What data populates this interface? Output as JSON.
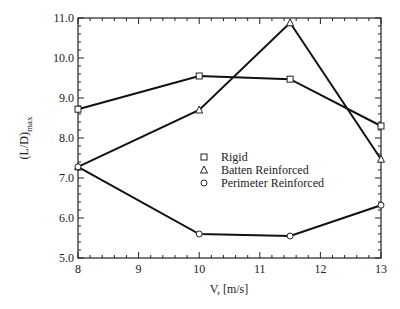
{
  "chart_data": {
    "type": "line",
    "title": "",
    "xlabel": "V, [m/s]",
    "ylabel": "(L/D)",
    "ylabel_subscript": "max",
    "xlim": [
      8,
      13
    ],
    "ylim": [
      5.0,
      11.0
    ],
    "x_ticks": [
      "8",
      "9",
      "10",
      "11",
      "12",
      "13"
    ],
    "y_ticks": [
      "5.0",
      "6.0",
      "7.0",
      "8.0",
      "9.0",
      "10.0",
      "11.0"
    ],
    "grid": false,
    "legend_position": "center",
    "x": [
      8,
      10,
      11.5,
      13
    ],
    "series": [
      {
        "name": "Rigid",
        "marker": "square",
        "values": [
          8.72,
          9.55,
          9.47,
          8.3
        ]
      },
      {
        "name": "Batten Reinforced",
        "marker": "triangle",
        "values": [
          7.28,
          8.7,
          10.88,
          7.47
        ]
      },
      {
        "name": "Perimeter Reinforced",
        "marker": "circle",
        "values": [
          7.28,
          5.6,
          5.55,
          6.32
        ]
      }
    ]
  }
}
